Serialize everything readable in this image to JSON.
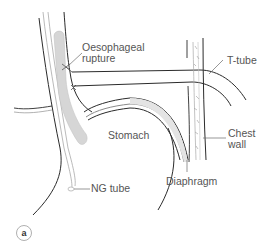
{
  "figure": {
    "panel_label": "a",
    "labels": {
      "oesophageal_rupture_line1": "Oesophageal",
      "oesophageal_rupture_line2": "rupture",
      "t_tube": "T-tube",
      "stomach": "Stomach",
      "chest_wall_line1": "Chest",
      "chest_wall_line2": "wall",
      "ng_tube": "NG tube",
      "diaphragm": "Diaphragm"
    },
    "colors": {
      "outline": "#2b2b2b",
      "thin_line": "#8a8a8a",
      "ng_tube_fill": "#d6d6d6",
      "label_text": "#555555"
    }
  }
}
